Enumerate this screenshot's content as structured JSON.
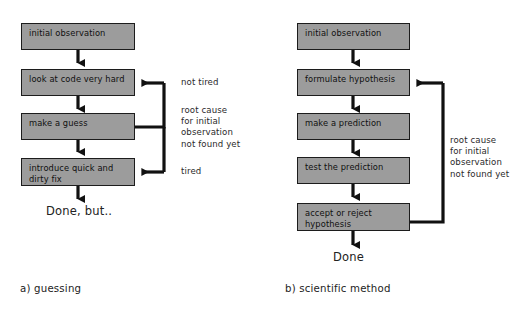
{
  "figure": {
    "background": "#ffffff",
    "box_fill": "#9c9c9c",
    "box_stroke": "#1c1c1c",
    "arrow_color": "#111111"
  },
  "left_diagram": {
    "caption": "a) guessing",
    "terminal": "Done, but..",
    "boxes": [
      {
        "label": "initial observation"
      },
      {
        "label": "look at code very hard"
      },
      {
        "label": "make a guess"
      },
      {
        "label": "introduce quick and\ndirty fix"
      }
    ],
    "loop_labels": [
      {
        "text": "not tired"
      },
      {
        "text": "root cause\nfor initial\nobservation\nnot found yet"
      },
      {
        "text": "tired"
      }
    ]
  },
  "right_diagram": {
    "caption": "b) scientific method",
    "terminal": "Done",
    "boxes": [
      {
        "label": "initial observation"
      },
      {
        "label": "formulate hypothesis"
      },
      {
        "label": "make a prediction"
      },
      {
        "label": "test the prediction"
      },
      {
        "label": "accept or reject\nhypothesis"
      }
    ],
    "loop_labels": [
      {
        "text": "root cause\nfor initial\nobservation\nnot found yet"
      }
    ]
  }
}
